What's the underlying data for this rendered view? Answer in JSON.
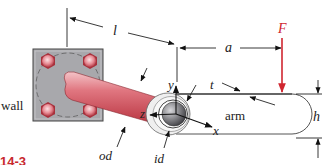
{
  "diagram": {
    "labels": {
      "wall": "wall",
      "length": "l",
      "offset": "a",
      "force": "F",
      "thickness": "t",
      "y_axis": "y",
      "z_axis": "z",
      "x_axis": "x",
      "arm": "arm",
      "height": "h",
      "outer_diameter": "od",
      "inner_diameter": "id"
    },
    "figure_number": "14-3",
    "colors": {
      "tube": "#d9545e",
      "tube_highlight": "#f2b8bc",
      "plate": "#a9a9ad",
      "bolt": "#e07a84",
      "force_arrow": "#d02630",
      "line": "#333333",
      "figure_label": "#c8282e"
    }
  }
}
